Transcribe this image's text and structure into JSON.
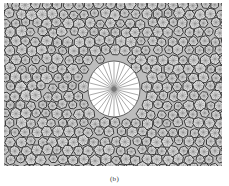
{
  "figure": {
    "width": 218,
    "height": 163,
    "cell_spacing": 10.5,
    "cell_radius": 5.2,
    "cell_fill": "#d9d9d9",
    "cell_stroke": "#3a3a3a",
    "cell_inner_stroke": "#8a8a8a",
    "background": "#bdbdbd",
    "hole": {
      "cx": 110,
      "cy": 86,
      "rx": 26,
      "ry": 28,
      "fill": "#ffffff",
      "spokes": 28,
      "spoke_color": "#555555"
    }
  },
  "caption": {
    "text": "(b)"
  }
}
